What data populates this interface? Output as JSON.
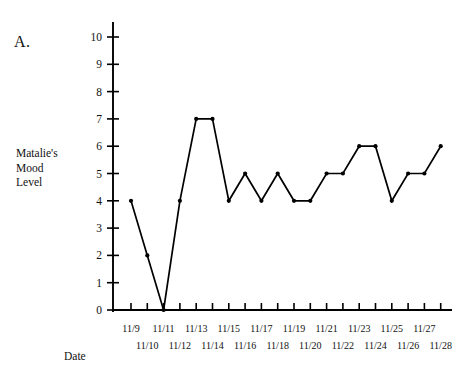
{
  "panel": {
    "letter": "A."
  },
  "axis_titles": {
    "y": "Matalie's\nMood\nLevel",
    "x": "Date"
  },
  "chart_data": {
    "type": "line",
    "title": "",
    "xlabel": "Date",
    "ylabel": "Matalie's Mood Level",
    "categories": [
      "11/9",
      "11/10",
      "11/11",
      "11/12",
      "11/13",
      "11/14",
      "11/15",
      "11/16",
      "11/17",
      "11/18",
      "11/19",
      "11/20",
      "11/21",
      "11/22",
      "11/23",
      "11/24",
      "11/25",
      "11/26",
      "11/27",
      "11/28"
    ],
    "values": [
      4,
      2,
      0,
      4,
      7,
      7,
      4,
      5,
      4,
      5,
      4,
      4,
      5,
      5,
      6,
      6,
      4,
      5,
      5,
      6
    ],
    "ylim": [
      0,
      10
    ],
    "yticks": [
      0,
      1,
      2,
      3,
      4,
      5,
      6,
      7,
      8,
      9,
      10
    ],
    "ytick_labels": [
      "0",
      "1",
      "2",
      "3",
      "4",
      "5",
      "6",
      "7",
      "8",
      "9",
      "10"
    ],
    "grid": false,
    "legend": false,
    "markers": true,
    "line_color": "#000000",
    "marker_color": "#000000",
    "xtick_row_top": [
      "11/9",
      "11/11",
      "11/13",
      "11/15",
      "11/17",
      "11/19",
      "11/21",
      "11/23",
      "11/25",
      "11/27"
    ],
    "xtick_row_bottom": [
      "11/10",
      "11/12",
      "11/14",
      "11/16",
      "11/18",
      "11/20",
      "11/22",
      "11/24",
      "11/26",
      "11/28"
    ]
  }
}
